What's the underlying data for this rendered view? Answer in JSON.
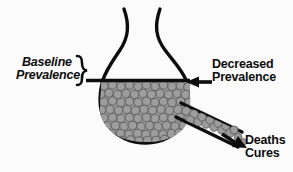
{
  "diagram": {
    "background_color": "#fbfbfb",
    "ink_color": "#0d0d0d",
    "cell_fill_color": "#9b9b9b",
    "cell_stroke_color": "#5e5e5e",
    "labels": {
      "baseline": {
        "line1": "Baseline",
        "line2": "Prevalence"
      },
      "decreased": {
        "line1": "Decreased",
        "line2": "Prevalence"
      },
      "outflow": {
        "line1": "Deaths",
        "line2": "Cures"
      }
    },
    "annotations": {
      "brace": "}",
      "baseline_rule": "horizontal-fill-level-line",
      "decreased_arrow": "left-pointing-arrow",
      "outflow_arrow": "right-pointing-arrow"
    },
    "shapes": {
      "vessel": "flask-with-flared-neck-and-round-bulb",
      "spout": "angled-outflow-tube",
      "contents": "packed-gray-circles"
    }
  }
}
